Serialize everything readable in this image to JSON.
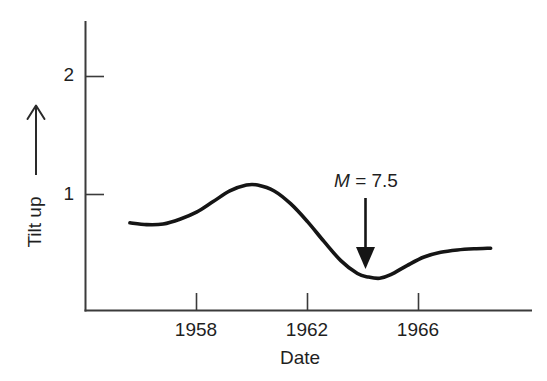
{
  "chart_data": {
    "type": "line",
    "title": "",
    "subtitle": "",
    "xlabel": "Date",
    "ylabel": "Tilt up",
    "ylabel_direction_icon": "up-arrow",
    "grid": false,
    "legend": null,
    "legend_position": "none",
    "xlim": [
      1955.3,
      1968.7
    ],
    "ylim": [
      0.0,
      2.45
    ],
    "x_ticks": [
      1958,
      1962,
      1966
    ],
    "x_tick_labels": [
      "1958",
      "1962",
      "1966"
    ],
    "y_ticks": [
      1,
      2
    ],
    "y_tick_labels": [
      "1",
      "2"
    ],
    "tick_direction": "in",
    "axis_color": "#3b3b3b",
    "curve_color": "#151515",
    "series": [
      {
        "name": "Tilt",
        "x": [
          1955.6,
          1956.2,
          1956.8,
          1957.4,
          1958.0,
          1958.6,
          1959.2,
          1959.8,
          1960.2,
          1960.8,
          1961.4,
          1962.0,
          1962.6,
          1963.2,
          1963.8,
          1964.2,
          1964.6,
          1965.0,
          1965.6,
          1966.2,
          1966.8,
          1967.4,
          1968.0,
          1968.6
        ],
        "y": [
          0.76,
          0.745,
          0.75,
          0.79,
          0.85,
          0.94,
          1.03,
          1.08,
          1.08,
          1.03,
          0.92,
          0.77,
          0.6,
          0.44,
          0.33,
          0.3,
          0.29,
          0.32,
          0.4,
          0.47,
          0.51,
          0.53,
          0.54,
          0.545
        ]
      }
    ],
    "annotations": [
      {
        "label_prefix": "M",
        "label_rest": " = 7.5",
        "label_full": "M = 7.5",
        "marker": "down-arrow",
        "x": 1964.35,
        "y_text": 1.08,
        "y_tip": 0.37
      }
    ]
  },
  "figure": {
    "background_color": "#ffffff",
    "width": 547,
    "height": 381
  }
}
